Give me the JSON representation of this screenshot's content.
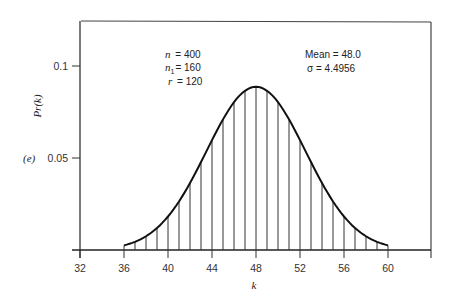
{
  "chart_data": {
    "type": "bar",
    "subtype": "stem-under-curve",
    "title": "",
    "panel_label": "(e)",
    "xlabel": "k",
    "ylabel": "Pr(k)",
    "xlim": [
      32,
      64
    ],
    "ylim": [
      0,
      0.12
    ],
    "x_ticks": [
      32,
      36,
      40,
      44,
      48,
      52,
      56,
      60
    ],
    "y_ticks": [
      0.05,
      0.1
    ],
    "y_tick_labels": [
      "0.05",
      "0.1"
    ],
    "grid": false,
    "legend": null,
    "annotations": {
      "left": [
        "n = 400",
        "n1 = 160",
        "r = 120"
      ],
      "right": [
        "Mean = 48.0",
        "σ = 4.4956"
      ]
    },
    "params": {
      "n": 400,
      "n1": 160,
      "r": 120,
      "mean": 48.0,
      "sigma": 4.4956
    },
    "x": [
      36,
      37,
      38,
      39,
      40,
      41,
      42,
      43,
      44,
      45,
      46,
      47,
      48,
      49,
      50,
      51,
      52,
      53,
      54,
      55,
      56,
      57,
      58,
      59,
      60
    ],
    "values": [
      0.0025,
      0.0044,
      0.0075,
      0.012,
      0.0182,
      0.0264,
      0.0364,
      0.0478,
      0.0597,
      0.071,
      0.0804,
      0.0866,
      0.0887,
      0.0866,
      0.0804,
      0.071,
      0.0597,
      0.0478,
      0.0364,
      0.0264,
      0.0182,
      0.012,
      0.0075,
      0.0044,
      0.0025
    ]
  },
  "labels": {
    "panel": "(e)",
    "ylabel": "Pr(k)",
    "xlabel": "k",
    "n_line": "n = 400",
    "n1_var": "n",
    "n1_sub": "1",
    "n1_val": "= 160",
    "r_line": "r = 120",
    "mean_line": "Mean = 48.0",
    "sigma_line": "σ = 4.4956"
  }
}
